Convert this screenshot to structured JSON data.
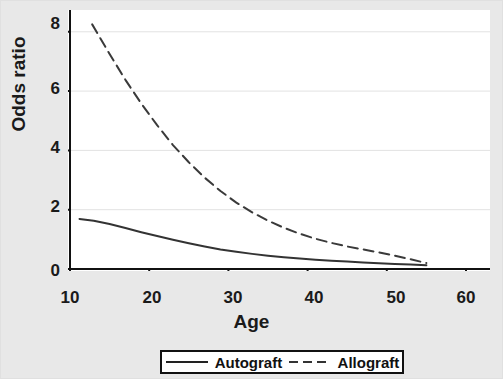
{
  "chart_data": {
    "type": "line",
    "title": "",
    "xlabel": "Age",
    "ylabel": "Odds ratio",
    "xlim": [
      10,
      60
    ],
    "ylim": [
      0,
      8.6
    ],
    "xticks": [
      10,
      20,
      30,
      40,
      50,
      60
    ],
    "yticks": [
      0,
      2,
      4,
      6,
      8
    ],
    "grid": "horizontal",
    "legend_position": "below-bottom-center",
    "series": [
      {
        "name": "Autograft",
        "style": "solid",
        "color": "#333333",
        "x": [
          11.2,
          13,
          15,
          17,
          19,
          21,
          23,
          25,
          27,
          29,
          31,
          33,
          35,
          37,
          39,
          41,
          43,
          45,
          47,
          49,
          51,
          53,
          55
        ],
        "y": [
          1.69,
          1.63,
          1.52,
          1.38,
          1.24,
          1.11,
          0.99,
          0.87,
          0.76,
          0.66,
          0.58,
          0.51,
          0.45,
          0.4,
          0.35,
          0.31,
          0.28,
          0.25,
          0.22,
          0.19,
          0.17,
          0.15,
          0.13
        ]
      },
      {
        "name": "Allograft",
        "style": "dashed",
        "color": "#3a3a3a",
        "x": [
          12.8,
          15,
          17,
          19,
          21,
          23,
          25,
          27,
          29,
          31,
          33,
          35,
          37,
          39,
          41,
          43,
          45,
          47,
          49,
          51,
          53,
          55
        ],
        "y": [
          8.25,
          7.25,
          6.38,
          5.58,
          4.85,
          4.18,
          3.6,
          3.08,
          2.63,
          2.24,
          1.91,
          1.63,
          1.39,
          1.19,
          1.02,
          0.88,
          0.76,
          0.66,
          0.56,
          0.45,
          0.33,
          0.2
        ]
      }
    ]
  },
  "legend": {
    "entries": [
      {
        "label": "Autograft",
        "style": "solid"
      },
      {
        "label": "Allograft",
        "style": "dashed"
      }
    ]
  },
  "colors": {
    "background": "#e8e8e8",
    "plot_background": "#ffffff",
    "axis": "#111111",
    "gridline": "#e2e2e2",
    "text": "#1a1a1a"
  }
}
